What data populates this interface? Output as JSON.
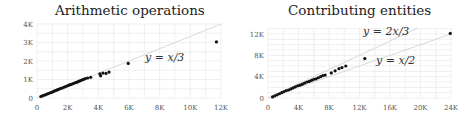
{
  "chart_data": [
    {
      "type": "scatter",
      "title": "Arithmetic operations",
      "xlabel": "",
      "ylabel": "",
      "xlim": [
        0,
        12000
      ],
      "ylim": [
        0,
        4000
      ],
      "xticks": [
        "0",
        "2K",
        "4K",
        "6K",
        "8K",
        "10K",
        "12K"
      ],
      "yticks": [
        "0",
        "1K",
        "2K",
        "3K",
        "4K"
      ],
      "grid": true,
      "reference_lines": [
        {
          "label": "y = x/3",
          "slope": 0.3333
        }
      ],
      "points": [
        [
          250,
          80
        ],
        [
          350,
          110
        ],
        [
          450,
          150
        ],
        [
          550,
          170
        ],
        [
          650,
          210
        ],
        [
          750,
          240
        ],
        [
          850,
          280
        ],
        [
          950,
          300
        ],
        [
          1050,
          340
        ],
        [
          1150,
          380
        ],
        [
          1250,
          410
        ],
        [
          1350,
          450
        ],
        [
          1450,
          480
        ],
        [
          1550,
          520
        ],
        [
          1650,
          540
        ],
        [
          1750,
          580
        ],
        [
          1850,
          610
        ],
        [
          1950,
          650
        ],
        [
          2050,
          680
        ],
        [
          2150,
          720
        ],
        [
          2250,
          740
        ],
        [
          2350,
          780
        ],
        [
          2450,
          810
        ],
        [
          2550,
          840
        ],
        [
          2650,
          870
        ],
        [
          2750,
          910
        ],
        [
          2850,
          940
        ],
        [
          2950,
          980
        ],
        [
          3050,
          1010
        ],
        [
          3150,
          1050
        ],
        [
          3300,
          1080
        ],
        [
          3500,
          1120
        ],
        [
          4100,
          1300
        ],
        [
          4150,
          1200
        ],
        [
          4300,
          1350
        ],
        [
          4500,
          1330
        ],
        [
          4700,
          1400
        ],
        [
          5950,
          1870
        ],
        [
          11700,
          3030
        ]
      ]
    },
    {
      "type": "scatter",
      "title": "Contributing entities",
      "xlabel": "",
      "ylabel": "",
      "xlim": [
        0,
        24000
      ],
      "ylim": [
        0,
        13000
      ],
      "xticks": [
        "0",
        "4K",
        "8K",
        "12K",
        "16K",
        "20K",
        "24K"
      ],
      "yticks": [
        "0",
        "4K",
        "8K",
        "12K"
      ],
      "grid": true,
      "reference_lines": [
        {
          "label": "y = 2x/3",
          "slope": 0.6667
        },
        {
          "label": "y = x/2",
          "slope": 0.5
        }
      ],
      "points": [
        [
          600,
          200
        ],
        [
          900,
          400
        ],
        [
          1200,
          600
        ],
        [
          1500,
          800
        ],
        [
          1800,
          1000
        ],
        [
          2100,
          1200
        ],
        [
          2400,
          1400
        ],
        [
          2700,
          1500
        ],
        [
          3000,
          1700
        ],
        [
          3300,
          1900
        ],
        [
          3600,
          2100
        ],
        [
          3900,
          2300
        ],
        [
          4200,
          2400
        ],
        [
          4500,
          2600
        ],
        [
          4800,
          2800
        ],
        [
          5100,
          3000
        ],
        [
          5400,
          3100
        ],
        [
          5700,
          3300
        ],
        [
          6000,
          3500
        ],
        [
          6300,
          3600
        ],
        [
          6600,
          3800
        ],
        [
          6900,
          4000
        ],
        [
          7200,
          4200
        ],
        [
          7500,
          4300
        ],
        [
          8300,
          4700
        ],
        [
          8800,
          5100
        ],
        [
          9300,
          5500
        ],
        [
          9700,
          5700
        ],
        [
          10200,
          6000
        ],
        [
          12700,
          7400
        ],
        [
          23900,
          12100
        ]
      ]
    }
  ],
  "panels": {
    "left": {
      "title": "Arithmetic operations",
      "annotation": "y = x/3"
    },
    "right": {
      "title": "Contributing entities",
      "annotation_upper": "y = 2x/3",
      "annotation_lower": "y = x/2"
    }
  }
}
